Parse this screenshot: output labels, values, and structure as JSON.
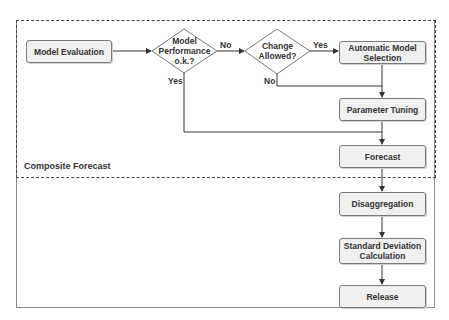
{
  "diagram": {
    "group_label": "Composite Forecast",
    "nodes": {
      "model_evaluation": "Model Evaluation",
      "decision_performance": [
        "Model",
        "Performance",
        "o.k.?"
      ],
      "decision_change": [
        "Change",
        "Allowed?"
      ],
      "automatic_model_selection": [
        "Automatic Model",
        "Selection"
      ],
      "parameter_tuning": "Parameter Tuning",
      "forecast": "Forecast",
      "disaggregation": "Disaggregation",
      "std_dev_calc": [
        "Standard Deviation",
        "Calculation"
      ],
      "release": "Release"
    },
    "edge_labels": {
      "performance_no": "No",
      "performance_yes": "Yes",
      "change_yes": "Yes",
      "change_no": "No"
    },
    "colors": {
      "node_fill": "#f0f0f0",
      "node_border": "#7a7a7a",
      "line": "#333333"
    }
  }
}
